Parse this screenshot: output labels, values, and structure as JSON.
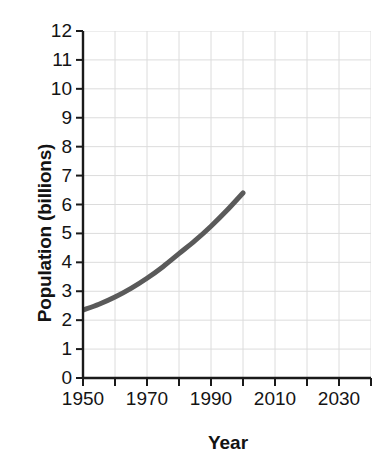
{
  "chart_data": {
    "type": "line",
    "title": "",
    "xlabel": "Year",
    "ylabel": "Population (billions)",
    "xlim": [
      1950,
      2040
    ],
    "ylim": [
      0,
      12
    ],
    "grid": true,
    "legend": null,
    "x_ticks": [
      1950,
      1960,
      1970,
      1980,
      1990,
      2000,
      2010,
      2020,
      2030,
      2040
    ],
    "x_tick_labels": [
      "1950",
      "",
      "1970",
      "",
      "1990",
      "",
      "2010",
      "",
      "2030",
      ""
    ],
    "x_labeled_ticks": [
      {
        "value": 1950,
        "label": "1950"
      },
      {
        "value": 1970,
        "label": "1970"
      },
      {
        "value": 1990,
        "label": "1990"
      },
      {
        "value": 2010,
        "label": "2010"
      },
      {
        "value": 2030,
        "label": "2030"
      }
    ],
    "y_ticks": [
      0,
      1,
      2,
      3,
      4,
      5,
      6,
      7,
      8,
      9,
      10,
      11,
      12
    ],
    "y_tick_labels": [
      "0",
      "1",
      "2",
      "3",
      "4",
      "5",
      "6",
      "7",
      "8",
      "9",
      "10",
      "11",
      "12"
    ],
    "series": [
      {
        "name": "World population",
        "color": "#5a5a5a",
        "line_width": 5,
        "x": [
          1950,
          1955,
          1960,
          1965,
          1970,
          1975,
          1980,
          1985,
          1990,
          1995,
          2000
        ],
        "values": [
          2.35,
          2.55,
          2.8,
          3.1,
          3.45,
          3.85,
          4.3,
          4.75,
          5.25,
          5.8,
          6.4
        ]
      }
    ],
    "colors": {
      "line": "#5a5a5a",
      "axis": "#1a1a1a",
      "grid": "#dcdcdc",
      "text": "#141414",
      "background": "#ffffff"
    }
  }
}
